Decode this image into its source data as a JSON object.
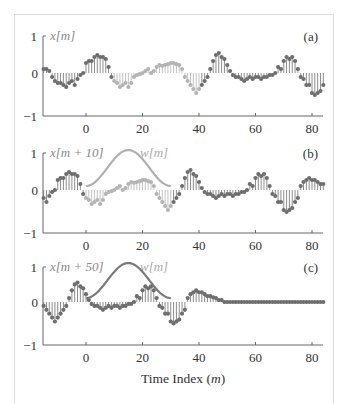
{
  "chart_data": {
    "type": "stem",
    "xlabel": "Time Index (m)",
    "xlabel_parts": {
      "text": "Time Index (",
      "var": "m",
      "close": ")"
    },
    "xlim": [
      -16,
      84
    ],
    "ylim": [
      -1,
      1
    ],
    "x_ticks": [
      0,
      20,
      40,
      60,
      80
    ],
    "y_ticks": [
      -1,
      0,
      1
    ],
    "colors": {
      "dark": "#6e6e6e",
      "light": "#b4b4b4",
      "window": "#b0b0b0",
      "window_c": "#7a7a7a",
      "axis": "#666666"
    },
    "signal_x": {
      "m_start": -15,
      "values": [
        0.1,
        0.1,
        0.05,
        -0.1,
        -0.2,
        -0.25,
        -0.25,
        -0.3,
        -0.35,
        -0.25,
        -0.2,
        -0.3,
        -0.15,
        -0.05,
        0.0,
        0.25,
        0.3,
        0.3,
        0.4,
        0.45,
        0.4,
        0.4,
        0.35,
        0.15,
        -0.1,
        -0.2,
        -0.25,
        -0.35,
        -0.3,
        -0.25,
        -0.35,
        -0.25,
        -0.1,
        -0.05,
        -0.03,
        0.0,
        0.05,
        0.1,
        0.0,
        0.05,
        0.15,
        0.2,
        0.18,
        0.2,
        0.22,
        0.25,
        0.25,
        0.22,
        0.2,
        0.1,
        -0.1,
        -0.2,
        -0.3,
        -0.4,
        -0.5,
        -0.4,
        -0.3,
        -0.2,
        -0.1,
        0.1,
        0.3,
        0.45,
        0.5,
        0.4,
        0.35,
        0.2,
        0.05,
        -0.05,
        -0.1,
        -0.1,
        -0.15,
        -0.2,
        -0.15,
        -0.1,
        -0.15,
        -0.1,
        -0.1,
        -0.15,
        -0.1,
        -0.1,
        -0.05,
        -0.05,
        0.0,
        0.15,
        0.1,
        0.3,
        0.4,
        0.35,
        0.4,
        0.3,
        0.1,
        -0.1,
        -0.15,
        -0.3,
        -0.3,
        -0.5,
        -0.55,
        -0.5,
        -0.45,
        -0.3,
        -0.2,
        0.1,
        0.2,
        0.25,
        0.3,
        0.25,
        0.25,
        0.2,
        0.15,
        0.15,
        0.12,
        0.1,
        0.05,
        0.05
      ]
    },
    "panels": [
      {
        "id": "a",
        "tag": "(a)",
        "series_label": "x[m]",
        "shift": 0,
        "highlight_range": [
          10,
          40
        ],
        "window": false,
        "axis_y": {
          "top": 36,
          "zero": 73,
          "bottom": 116
        }
      },
      {
        "id": "b",
        "tag": "(b)",
        "series_label": "x[m + 10]",
        "window_label": "w[m]",
        "shift": 10,
        "highlight_range": [
          0,
          30
        ],
        "window": true,
        "window_range": [
          0,
          30
        ],
        "axis_y": {
          "top": 153,
          "zero": 190,
          "bottom": 233
        }
      },
      {
        "id": "c",
        "tag": "(c)",
        "series_label": "x[m + 50]",
        "window_label": "w[m]",
        "shift": 50,
        "highlight_range": null,
        "window": true,
        "window_range": [
          0,
          30
        ],
        "axis_y": {
          "top": 267,
          "zero": 302,
          "bottom": 345
        }
      }
    ]
  },
  "labels": {
    "y_one": "1",
    "y_zero": "0",
    "y_neg_one": "−1",
    "x_ticks": [
      "0",
      "20",
      "40",
      "60",
      "80"
    ]
  }
}
